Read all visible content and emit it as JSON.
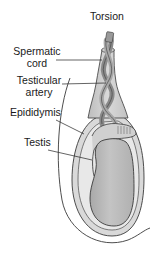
{
  "diagram": {
    "labels": {
      "torsion": "Torsion",
      "spermatic_cord_line1": "Spermatic",
      "spermatic_cord_line2": "cord",
      "testicular_artery_line1": "Testicular",
      "testicular_artery_line2": "artery",
      "epididymis": "Epididymis",
      "testis": "Testis"
    },
    "colors": {
      "outline": "#3a3a3a",
      "tunica_fill": "#d6d6d6",
      "tunica_inner_fill": "#e9e9e9",
      "testis_fill": "#b8b8b8",
      "cord_fill": "#c9c9c9",
      "vessel_dark": "#8a8a8a",
      "vessel_mid": "#a5a5a5",
      "leader_line": "#222222",
      "background": "#ffffff"
    }
  }
}
